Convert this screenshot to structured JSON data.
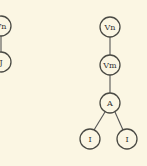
{
  "diagram": {
    "background": "#fbf6e3",
    "trees": [
      {
        "name": "left-tree",
        "nodes": [
          {
            "id": "l1",
            "label": "Vn"
          },
          {
            "id": "l2",
            "label": "J"
          }
        ],
        "edges": [
          [
            "l1",
            "l2"
          ]
        ]
      },
      {
        "name": "right-tree",
        "nodes": [
          {
            "id": "r1",
            "label": "Vn"
          },
          {
            "id": "r2",
            "label": "Vm"
          },
          {
            "id": "r3",
            "label": "A"
          },
          {
            "id": "r4",
            "label": "I"
          },
          {
            "id": "r5",
            "label": "I"
          }
        ],
        "edges": [
          [
            "r1",
            "r2"
          ],
          [
            "r2",
            "r3"
          ],
          [
            "r3",
            "r4"
          ],
          [
            "r3",
            "r5"
          ]
        ]
      }
    ]
  }
}
